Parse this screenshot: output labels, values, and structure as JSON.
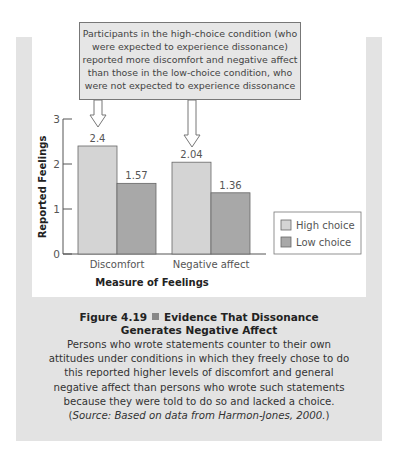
{
  "callout": {
    "lines": [
      "Participants in the high-choice condition (who",
      "were expected to experience dissonance)",
      "reported more discomfort and negative affect",
      "than those in the low-choice condition, who",
      "were not expected to experience dissonance"
    ]
  },
  "caption": {
    "figure_label": "Figure 4.19",
    "title_line1": "Evidence That Dissonance",
    "title_line2": "Generates Negative Affect",
    "body_lines": [
      "Persons who wrote statements counter to their own",
      "attitudes under conditions in which they freely chose to do",
      "this reported higher levels of discomfort and general",
      "negative affect than persons who wrote such statements",
      "because they were told to do so and lacked a choice."
    ],
    "source_open": "(",
    "source_italic": "Source: Based on data from Harmon-Jones, 2000.",
    "source_close": ")"
  },
  "chart_data": {
    "type": "bar",
    "title": "",
    "xlabel": "Measure of Feelings",
    "ylabel": "Reported Feelings",
    "ylim": [
      0,
      3
    ],
    "yticks": [
      "0",
      "1",
      "2",
      "3"
    ],
    "categories": [
      "Discomfort",
      "Negative affect"
    ],
    "series": [
      {
        "name": "High choice",
        "values": [
          2.4,
          2.04
        ],
        "labels": [
          "2.4",
          "2.04"
        ],
        "color": "#d4d4d4"
      },
      {
        "name": "Low choice",
        "values": [
          1.57,
          1.36
        ],
        "labels": [
          "1.57",
          "1.36"
        ],
        "color": "#a8a8a8"
      }
    ],
    "legend_position": "right",
    "grid": false
  }
}
